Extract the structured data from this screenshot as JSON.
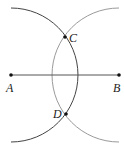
{
  "diagram": {
    "type": "perpendicular-bisector-construction",
    "points": [
      {
        "id": "A",
        "label": "A",
        "x": 11,
        "y": 75
      },
      {
        "id": "B",
        "label": "B",
        "x": 119,
        "y": 75
      },
      {
        "id": "C",
        "label": "C",
        "x": 65,
        "y": 37
      },
      {
        "id": "D",
        "label": "D",
        "x": 66,
        "y": 114
      }
    ],
    "segment": {
      "from": "A",
      "to": "B"
    },
    "arcs": [
      {
        "center": "A",
        "radius": 67,
        "color": "#444444"
      },
      {
        "center": "B",
        "radius": 67,
        "color": "#9a9a9a"
      }
    ],
    "colors": {
      "line": "#555555",
      "dark_arc": "#444444",
      "light_arc": "#9a9a9a",
      "point": "#111111"
    }
  }
}
